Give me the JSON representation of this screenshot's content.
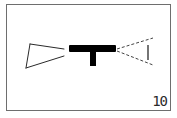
{
  "frame": {
    "number": "10",
    "border_color": "#6e6e6e",
    "background": "#ffffff"
  },
  "diagram": {
    "elements": [
      {
        "name": "left-open-trapezoid",
        "style": "thin outline",
        "color": "#2a2a2a"
      },
      {
        "name": "center-t-shape",
        "style": "solid fill",
        "color": "#000000"
      },
      {
        "name": "right-dashed-converging-lines",
        "style": "dashed",
        "color": "#444444"
      },
      {
        "name": "right-vertical-bar",
        "style": "thin line",
        "color": "#2a2a2a"
      }
    ]
  }
}
